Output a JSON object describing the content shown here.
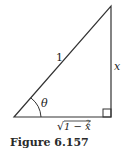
{
  "figure": {
    "caption": "Figure 6.157",
    "labels": {
      "hypotenuse": "1",
      "opposite": "x",
      "angle": "θ",
      "adjacent_radicand": "1 − x",
      "adjacent_exponent": "2",
      "adjacent_radical": "√"
    },
    "colors": {
      "line": "#333333",
      "text": "#222222"
    }
  }
}
